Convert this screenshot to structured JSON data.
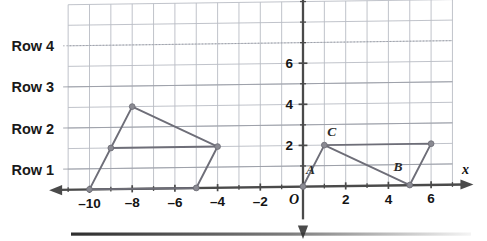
{
  "page": {
    "background_color": "#ffffff"
  },
  "colors": {
    "grid_line": "#b9bcc4",
    "grid_line_accent": "#9a9da6",
    "axis": "#4a4a4a",
    "shape_stroke": "#6e6e78",
    "marker": "#8a8a92",
    "text": "#141414",
    "bottom_bar": "#2e2e2e"
  },
  "row_labels": [
    {
      "text": "Row 1",
      "y_value": 1
    },
    {
      "text": "Row 2",
      "y_value": 3
    },
    {
      "text": "Row 3",
      "y_value": 5
    },
    {
      "text": "Row 4",
      "y_value": 7
    }
  ],
  "axes": {
    "x_axis_name": "x",
    "y_axis_name": "y",
    "origin_label": "O",
    "x_ticks": [
      {
        "label": "–10",
        "value": -10
      },
      {
        "label": "–8",
        "value": -8
      },
      {
        "label": "–6",
        "value": -6
      },
      {
        "label": "–4",
        "value": -4
      },
      {
        "label": "–2",
        "value": -2
      },
      {
        "label": "2",
        "value": 2
      },
      {
        "label": "4",
        "value": 4
      },
      {
        "label": "6",
        "value": 6
      }
    ],
    "y_ticks": [
      {
        "label": "2",
        "value": 2
      },
      {
        "label": "4",
        "value": 4
      },
      {
        "label": "6",
        "value": 6
      }
    ]
  },
  "point_labels": [
    {
      "text": "A",
      "x": 0.35,
      "y": 0.62
    },
    {
      "text": "B",
      "x": 4.45,
      "y": 0.68
    },
    {
      "text": "C",
      "x": 1.35,
      "y": 2.45
    }
  ],
  "chart_data": {
    "type": "scatter",
    "title": "",
    "xlabel": "x",
    "ylabel": "y",
    "xlim": [
      -11,
      7
    ],
    "ylim": [
      0,
      9
    ],
    "grid": true,
    "legend": "none",
    "x_tick_values": [
      -10,
      -8,
      -6,
      -4,
      -2,
      2,
      4,
      6
    ],
    "y_tick_values": [
      2,
      4,
      6
    ],
    "series": [
      {
        "name": "left-polygon",
        "closed": true,
        "points": [
          {
            "x": -10,
            "y": 0
          },
          {
            "x": -9,
            "y": 2
          },
          {
            "x": -8,
            "y": 4
          },
          {
            "x": -4,
            "y": 2
          },
          {
            "x": -5,
            "y": 0
          }
        ]
      },
      {
        "name": "left-inner-segment",
        "closed": false,
        "points": [
          {
            "x": -9,
            "y": 2
          },
          {
            "x": -4,
            "y": 2
          }
        ]
      },
      {
        "name": "right-polygon",
        "closed": false,
        "points": [
          {
            "x": 0,
            "y": 0
          },
          {
            "x": 1,
            "y": 2
          },
          {
            "x": 5,
            "y": 0
          },
          {
            "x": 6,
            "y": 2
          },
          {
            "x": 1,
            "y": 2
          }
        ]
      }
    ],
    "labeled_points": [
      {
        "label": "A",
        "x": 0,
        "y": 0
      },
      {
        "label": "B",
        "x": 5,
        "y": 0
      },
      {
        "label": "C",
        "x": 1,
        "y": 2
      }
    ],
    "markers": [
      {
        "x": -10,
        "y": 0
      },
      {
        "x": -9,
        "y": 2
      },
      {
        "x": -8,
        "y": 4
      },
      {
        "x": -5,
        "y": 0
      },
      {
        "x": -4,
        "y": 2
      },
      {
        "x": 0,
        "y": 0
      },
      {
        "x": 1,
        "y": 2
      },
      {
        "x": 5,
        "y": 0
      },
      {
        "x": 6,
        "y": 2
      }
    ]
  }
}
